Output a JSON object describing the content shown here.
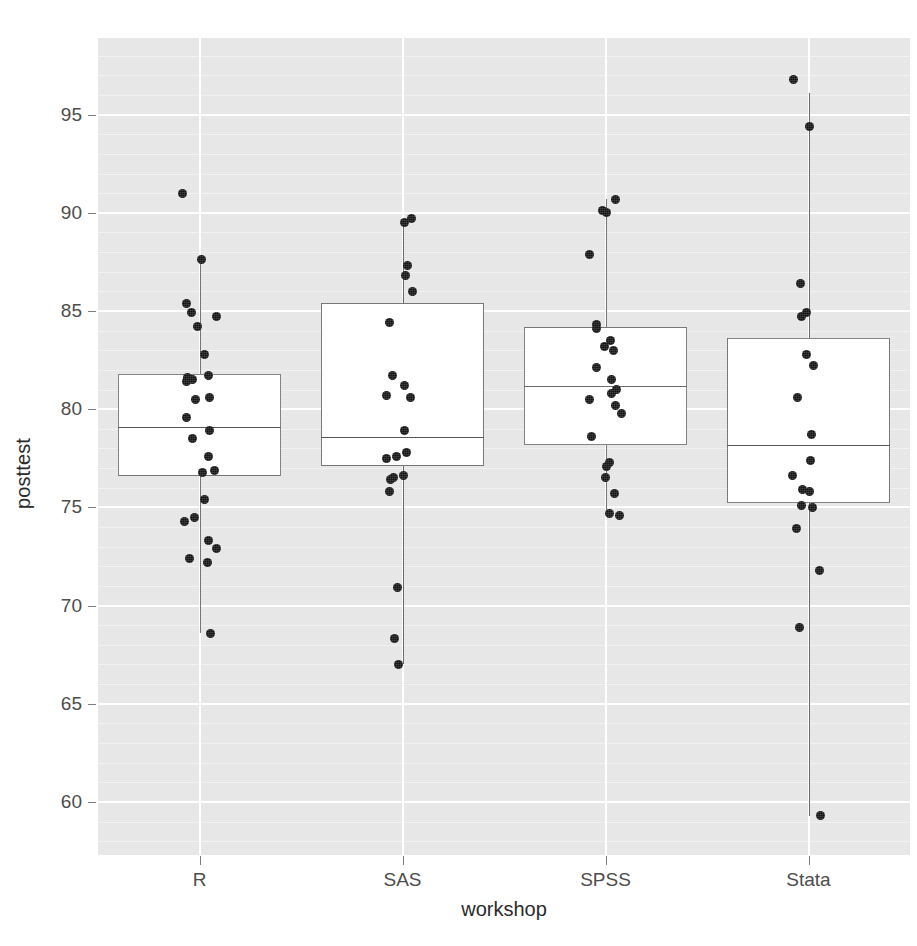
{
  "chart_data": {
    "type": "box",
    "title": "",
    "xlabel": "workshop",
    "ylabel": "posttest",
    "categories": [
      "R",
      "SAS",
      "SPSS",
      "Stata"
    ],
    "ylim": [
      57.3,
      98.9
    ],
    "yticks": [
      60,
      65,
      70,
      75,
      80,
      85,
      90,
      95
    ],
    "ytick_labels": [
      "60",
      "65",
      "70",
      "75",
      "80",
      "85",
      "90",
      "95"
    ],
    "grid": "horizontal-major-white",
    "legend": "none",
    "overlay": "jittered-points",
    "boxes": [
      {
        "category": "R",
        "whisker_low": 68.6,
        "q1": 76.6,
        "median": 79.1,
        "q3": 81.8,
        "whisker_high": 87.6,
        "outliers": [
          91.0
        ],
        "points": [
          91.0,
          87.6,
          85.4,
          84.9,
          84.7,
          84.2,
          82.8,
          81.7,
          81.6,
          81.5,
          81.4,
          80.6,
          80.5,
          79.6,
          78.9,
          78.5,
          77.6,
          76.9,
          76.8,
          75.4,
          74.5,
          74.3,
          73.3,
          72.9,
          72.4,
          72.2,
          68.6
        ]
      },
      {
        "category": "SAS",
        "whisker_low": 67.0,
        "q1": 77.1,
        "median": 78.6,
        "q3": 85.4,
        "whisker_high": 89.7,
        "outliers": [],
        "points": [
          89.7,
          89.5,
          87.3,
          86.8,
          86.0,
          84.4,
          81.7,
          81.2,
          80.7,
          80.6,
          78.9,
          77.8,
          77.6,
          77.5,
          76.6,
          76.5,
          76.4,
          75.8,
          70.9,
          68.3,
          67.0
        ]
      },
      {
        "category": "SPSS",
        "whisker_low": 74.6,
        "q1": 78.2,
        "median": 81.2,
        "q3": 84.2,
        "whisker_high": 90.7,
        "outliers": [],
        "points": [
          90.7,
          90.1,
          90.0,
          87.9,
          84.3,
          84.1,
          83.5,
          83.2,
          83.0,
          82.1,
          81.5,
          81.0,
          80.8,
          80.5,
          80.2,
          79.8,
          78.6,
          77.3,
          77.1,
          76.5,
          75.7,
          74.7,
          74.6
        ]
      },
      {
        "category": "Stata",
        "whisker_low": 59.3,
        "q1": 75.2,
        "median": 78.2,
        "q3": 83.6,
        "whisker_high": 96.1,
        "outliers": [
          96.8
        ],
        "points": [
          96.8,
          94.4,
          86.4,
          84.9,
          84.7,
          82.8,
          82.2,
          80.6,
          78.7,
          77.4,
          76.6,
          75.9,
          75.8,
          75.1,
          75.0,
          73.9,
          71.8,
          68.9,
          59.3
        ]
      }
    ],
    "colors": {
      "panel_background": "#e5e5e5",
      "gridline": "#ffffff",
      "box_fill": "#ffffff",
      "box_border": "#707070",
      "point": "#121212",
      "text": "#4d4d4d"
    }
  },
  "axis": {
    "y_title": "posttest",
    "x_title": "workshop"
  },
  "footer": {
    "scan_artifact": ""
  }
}
